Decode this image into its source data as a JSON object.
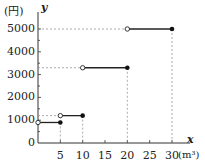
{
  "chart_data": {
    "type": "line",
    "subtype": "step",
    "title": "",
    "xlabel": "x",
    "x_unit": "(m³)",
    "ylabel": "y",
    "y_unit": "(円)",
    "xlim": [
      0,
      30
    ],
    "ylim": [
      0,
      5000
    ],
    "x_ticks": [
      0,
      5,
      10,
      15,
      20,
      25,
      30
    ],
    "y_ticks": [
      0,
      1000,
      2000,
      3000,
      4000,
      5000
    ],
    "x_tick_labels": [
      "5",
      "10",
      "15",
      "20",
      "25",
      "30"
    ],
    "y_tick_labels": [
      "0",
      "1000",
      "2000",
      "3000",
      "4000",
      "5000"
    ],
    "grid": false,
    "segments": [
      {
        "x_start": 0,
        "x_end": 5,
        "y": 900,
        "start_open": true,
        "end_closed": true
      },
      {
        "x_start": 5,
        "x_end": 10,
        "y": 1200,
        "start_open": true,
        "end_closed": true
      },
      {
        "x_start": 10,
        "x_end": 20,
        "y": 3300,
        "start_open": true,
        "end_closed": true
      },
      {
        "x_start": 20,
        "x_end": 30,
        "y": 5000,
        "start_open": true,
        "end_closed": true
      }
    ],
    "guide_lines": "dashed"
  },
  "labels": {
    "y_unit": "(円)",
    "y_var": "y",
    "x_var": "x",
    "x_unit": "(m³)",
    "origin": "0"
  }
}
